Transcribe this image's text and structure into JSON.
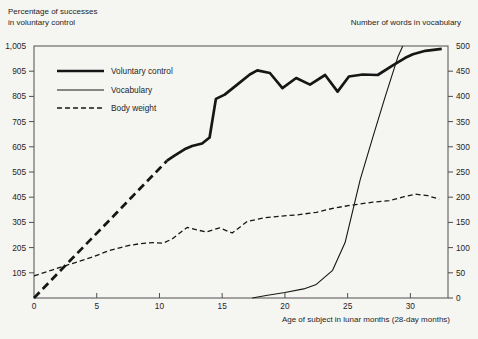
{
  "page": {
    "background": "#f5f5f2",
    "ink": "#161616",
    "frame_color": "#4f4f4f"
  },
  "titles": {
    "left_axis_line1": "Percentage of successes",
    "left_axis_line2": "in voluntary control",
    "right_axis": "Number of words in vocabulary",
    "x_axis": "Age of subject in lunar months (28-day months)"
  },
  "legend": {
    "items": [
      {
        "label": "Voluntary control",
        "style": "thick-solid"
      },
      {
        "label": "Vocabulary",
        "style": "thin-solid"
      },
      {
        "label": "Body weight",
        "style": "thin-dashed"
      }
    ]
  },
  "chart_data": {
    "type": "line",
    "title": "",
    "x_axis": {
      "label": "Age of subject in lunar months (28-day months)",
      "tick_labels": [
        "0",
        "5",
        "10",
        "15",
        "20",
        "25",
        "30"
      ],
      "tick_values": [
        0,
        5,
        10,
        15,
        20,
        25,
        30
      ],
      "range": [
        0,
        33
      ],
      "units": "lunar months (28-day months)"
    },
    "y_axis_left": {
      "label": "Percentage of successes in voluntary control",
      "tick_labels": [
        "1,005",
        "905",
        "805",
        "705",
        "605",
        "505",
        "405",
        "305",
        "205",
        "105"
      ],
      "tick_positions_right_equiv": [
        500,
        450,
        400,
        350,
        300,
        250,
        200,
        150,
        100,
        50
      ],
      "range_right_equiv": [
        0,
        500
      ],
      "note": "left labels sit on the same rows as right-axis ticks 500..50"
    },
    "y_axis_right": {
      "label": "Number of words in vocabulary",
      "tick_labels": [
        "500",
        "450",
        "400",
        "350",
        "300",
        "250",
        "200",
        "150",
        "100",
        "50",
        "0"
      ],
      "tick_values": [
        500,
        450,
        400,
        350,
        300,
        250,
        200,
        150,
        100,
        50,
        0
      ],
      "range": [
        0,
        500
      ]
    },
    "grid": false,
    "legend_position": "upper-left-inside",
    "series": [
      {
        "name": "Voluntary control",
        "axis": "left",
        "segments": [
          {
            "style": "thick-dashed",
            "points": [
              [
                0,
                5
              ],
              [
                2,
                108
              ],
              [
                4,
                211
              ],
              [
                6,
                313
              ],
              [
                8,
                416
              ],
              [
                10,
                519
              ],
              [
                10.6,
                550
              ]
            ]
          },
          {
            "style": "thick-solid",
            "points": [
              [
                10.6,
                550
              ],
              [
                11.2,
                570
              ],
              [
                12,
                595
              ],
              [
                12.6,
                608
              ],
              [
                13.4,
                618
              ],
              [
                14,
                642
              ],
              [
                14.5,
                795
              ],
              [
                15.2,
                812
              ],
              [
                16.2,
                852
              ],
              [
                17.2,
                892
              ],
              [
                17.8,
                908
              ],
              [
                18.8,
                898
              ],
              [
                19.8,
                838
              ],
              [
                20.9,
                878
              ],
              [
                22,
                852
              ],
              [
                23.2,
                890
              ],
              [
                24.2,
                824
              ],
              [
                25.1,
                884
              ],
              [
                26.2,
                892
              ],
              [
                27.4,
                890
              ],
              [
                28.6,
                928
              ],
              [
                29.6,
                958
              ],
              [
                30.2,
                972
              ],
              [
                31.2,
                986
              ],
              [
                32.5,
                994
              ]
            ]
          }
        ]
      },
      {
        "name": "Vocabulary",
        "axis": "right",
        "segments": [
          {
            "style": "thin-solid",
            "points": [
              [
                17.4,
                0
              ],
              [
                18.5,
                5
              ],
              [
                20,
                11
              ],
              [
                21.5,
                18
              ],
              [
                22.5,
                27
              ],
              [
                23.8,
                55
              ],
              [
                24.8,
                110
              ],
              [
                26,
                235
              ],
              [
                27,
                318
              ],
              [
                28,
                400
              ],
              [
                29,
                478
              ],
              [
                29.4,
                500
              ]
            ]
          }
        ]
      },
      {
        "name": "Body weight",
        "axis": "right",
        "segments": [
          {
            "style": "thin-dashed",
            "points": [
              [
                0,
                44
              ],
              [
                1.5,
                56
              ],
              [
                3,
                68
              ],
              [
                4.5,
                80
              ],
              [
                6,
                94
              ],
              [
                7.5,
                104
              ],
              [
                8.5,
                108
              ],
              [
                9.5,
                110
              ],
              [
                10.3,
                109
              ],
              [
                11,
                117
              ],
              [
                12.2,
                140
              ],
              [
                13.7,
                131
              ],
              [
                14.8,
                139
              ],
              [
                15.8,
                129
              ],
              [
                17,
                152
              ],
              [
                18.3,
                159
              ],
              [
                19.5,
                162
              ],
              [
                21,
                165
              ],
              [
                22.5,
                170
              ],
              [
                24,
                179
              ],
              [
                25.5,
                185
              ],
              [
                27,
                190
              ],
              [
                28.3,
                193
              ],
              [
                29.5,
                201
              ],
              [
                30.4,
                206
              ],
              [
                31.4,
                203
              ],
              [
                32.3,
                196
              ]
            ]
          }
        ]
      }
    ]
  }
}
